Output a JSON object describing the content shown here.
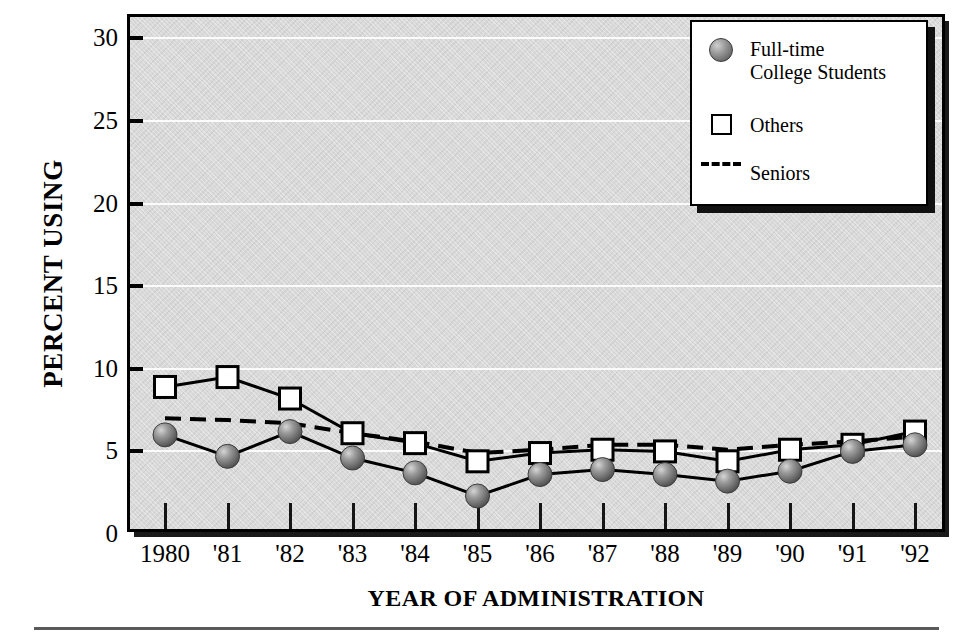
{
  "axes": {
    "ylabel": "PERCENT USING",
    "xlabel": "YEAR OF ADMINISTRATION",
    "yticks": [
      "0",
      "5",
      "10",
      "15",
      "20",
      "25",
      "30"
    ],
    "xticks": [
      "1980",
      "'81",
      "'82",
      "'83",
      "'84",
      "'85",
      "'86",
      "'87",
      "'88",
      "'89",
      "'90",
      "'91",
      "'92"
    ]
  },
  "legend": {
    "items": [
      {
        "label": "Full-time\nCollege Students",
        "marker": "filled-circle-marker"
      },
      {
        "label": "Others",
        "marker": "open-square-marker"
      },
      {
        "label": "Seniors",
        "marker": "dashed-line-marker"
      }
    ]
  },
  "colors": {
    "plot_background": "#d9d9d9",
    "gridline": "#fbfbfb",
    "axis": "#000000",
    "marker_circle": "#8a8a8a",
    "marker_square": "#ffffff",
    "line": "#000000"
  },
  "chart_data": {
    "type": "line",
    "title": "",
    "xlabel": "YEAR OF ADMINISTRATION",
    "ylabel": "PERCENT USING",
    "categories": [
      "1980",
      "'81",
      "'82",
      "'83",
      "'84",
      "'85",
      "'86",
      "'87",
      "'88",
      "'89",
      "'90",
      "'91",
      "'92"
    ],
    "ylim": [
      0,
      31.5
    ],
    "yticks": [
      0,
      5,
      10,
      15,
      20,
      25,
      30
    ],
    "grid": true,
    "legend_position": "top-right",
    "series": [
      {
        "name": "Full-time College Students",
        "marker": "filled-circle",
        "linestyle": "solid",
        "values": [
          6.0,
          4.7,
          6.2,
          4.6,
          3.7,
          2.3,
          3.6,
          3.9,
          3.6,
          3.2,
          3.8,
          5.0,
          5.4
        ]
      },
      {
        "name": "Others",
        "marker": "open-square",
        "linestyle": "solid",
        "values": [
          8.9,
          9.5,
          8.2,
          6.1,
          5.5,
          4.4,
          4.9,
          5.1,
          5.0,
          4.4,
          5.1,
          5.4,
          6.2
        ]
      },
      {
        "name": "Seniors",
        "marker": "none",
        "linestyle": "dashed",
        "values": [
          7.0,
          6.9,
          6.7,
          6.1,
          5.6,
          4.9,
          5.1,
          5.4,
          5.4,
          5.1,
          5.4,
          5.6,
          5.9
        ]
      }
    ]
  }
}
